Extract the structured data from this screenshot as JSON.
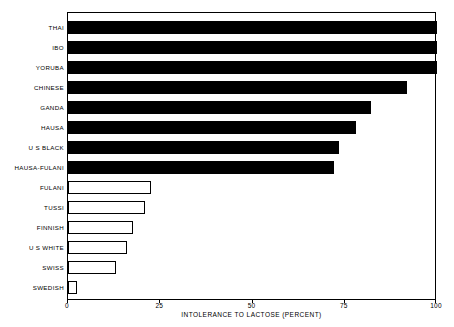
{
  "chart_data": {
    "type": "bar",
    "orientation": "horizontal",
    "title": "",
    "xlabel": "INTOLERANCE TO LACTOSE (PERCENT)",
    "ylabel": "",
    "xlim": [
      0,
      100
    ],
    "xticks": [
      "0",
      "25",
      "50",
      "75",
      "100"
    ],
    "xtick_values": [
      0,
      25,
      50,
      75,
      100
    ],
    "grid": false,
    "legend": false,
    "categories": [
      "THAI",
      "IBO",
      "YORUBA",
      "CHINESE",
      "GANDA",
      "HAUSA",
      "U S  BLACK",
      "HAUSA-FULANI",
      "FULANI",
      "TUSSI",
      "FINNISH",
      "U S  WHITE",
      "SWISS",
      "SWEDISH"
    ],
    "values": [
      100,
      100,
      100,
      92,
      82,
      78,
      73.5,
      72,
      22.5,
      21,
      17.7,
      16,
      13,
      2.5
    ],
    "bar_styles": [
      "filled",
      "filled",
      "filled",
      "filled",
      "filled",
      "filled",
      "filled",
      "filled",
      "hollow",
      "hollow",
      "hollow",
      "hollow",
      "hollow",
      "hollow"
    ],
    "colors": {
      "filled": "#000000",
      "hollow": "#ffffff",
      "outline": "#000000",
      "axis": "#000000",
      "background": "#ffffff"
    }
  }
}
